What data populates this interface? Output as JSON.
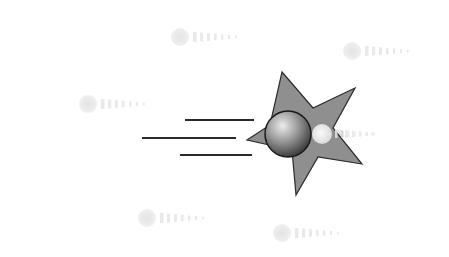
{
  "illustration": {
    "subject": "shooting-star clipart with ball",
    "background": "#ffffff",
    "star": {
      "fill": "#8f8f8f",
      "stroke": "#2a2a2a",
      "points": [
        [
          282,
          72
        ],
        [
          313,
          108
        ],
        [
          355,
          88
        ],
        [
          333,
          128
        ],
        [
          362,
          164
        ],
        [
          318,
          157
        ],
        [
          296,
          195
        ],
        [
          292,
          150
        ],
        [
          247,
          140
        ],
        [
          270,
          125
        ]
      ]
    },
    "ball": {
      "cx": 288,
      "cy": 134,
      "r": 23,
      "light": "#e8e8e8",
      "dark": "#3a3a3a",
      "stroke": "#1a1a1a"
    },
    "glow": {
      "cx": 322,
      "cy": 134,
      "r": 10,
      "color": "#f4f4f4"
    },
    "speed_lines": [
      {
        "x1": 185,
        "y1": 120,
        "x2": 254,
        "y2": 120
      },
      {
        "x1": 142,
        "y1": 138,
        "x2": 236,
        "y2": 138
      },
      {
        "x1": 180,
        "y1": 155,
        "x2": 252,
        "y2": 155
      }
    ],
    "speed_line_color": "#2a2a2a",
    "ghost_trails": [
      {
        "x": 180,
        "y": 37
      },
      {
        "x": 352,
        "y": 51
      },
      {
        "x": 88,
        "y": 104
      },
      {
        "x": 318,
        "y": 134
      },
      {
        "x": 147,
        "y": 218
      },
      {
        "x": 282,
        "y": 233
      }
    ],
    "ghost_color": "#e9e9e9"
  }
}
